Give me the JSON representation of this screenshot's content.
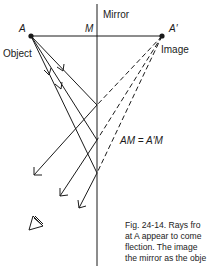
{
  "labels": {
    "mirror": "Mirror",
    "point_a": "A",
    "point_m": "M",
    "point_a_prime": "A′",
    "object": "Object",
    "image": "Image",
    "equation": "AM = A′M"
  },
  "caption": {
    "lines": [
      "Fig. 24-14.  Rays fro",
      "at A appear to come",
      "flection.  The image",
      "the mirror as the obje"
    ]
  },
  "colors": {
    "ink": "#1a1a1a",
    "background": "#ffffff"
  }
}
